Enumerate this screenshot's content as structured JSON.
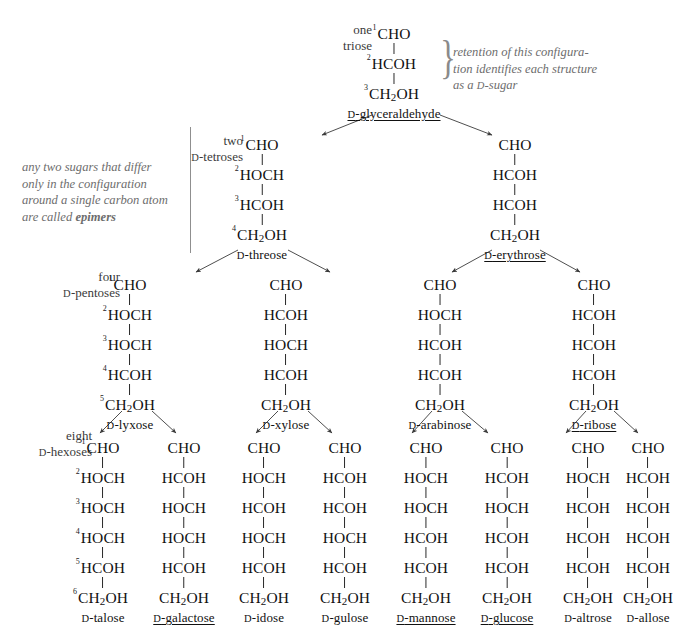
{
  "diagram": {
    "background": "#ffffff",
    "bond_color": "#2a2a2a",
    "annotation_color": "#6d6d6d"
  },
  "row_labels": [
    {
      "id": "triose",
      "line1": "one",
      "line2": "triose",
      "x": 372,
      "y": 22
    },
    {
      "id": "tetrose",
      "line1": "two",
      "line2": "D-tetroses",
      "x": 243,
      "y": 133
    },
    {
      "id": "pentose",
      "line1": "four",
      "line2": "D-pentoses",
      "x": 120,
      "y": 269
    },
    {
      "id": "hexose",
      "line1": "eight",
      "line2": "D-hexoses",
      "x": 92,
      "y": 428
    }
  ],
  "annotations": [
    {
      "id": "d-sugar-note",
      "x": 453,
      "y": 44,
      "brace_x": 437,
      "brace_y": 35,
      "lines": [
        "retention of this configura-",
        "tion identifies each structure",
        "as a D-sugar"
      ]
    },
    {
      "id": "epimer-note",
      "x": 22,
      "y": 159,
      "bar_x": 190,
      "bar_y": 127,
      "bar_h": 126,
      "lines": [
        "any two sugars that differ",
        "only in the configuration",
        "around a single carbon atom",
        "are called epimers"
      ],
      "bold_word": "epimers"
    }
  ],
  "structures": [
    {
      "id": "d-glyceraldehyde",
      "name": "D-glyceraldehyde",
      "underlined": true,
      "numbered": true,
      "x": 394,
      "y": 26,
      "groups": [
        "CHO",
        "HCOH",
        "CH2OH"
      ]
    },
    {
      "id": "d-threose",
      "name": "D-threose",
      "underlined": false,
      "numbered": true,
      "x": 262,
      "y": 137,
      "groups": [
        "CHO",
        "HOCH",
        "HCOH",
        "CH2OH"
      ]
    },
    {
      "id": "d-erythrose",
      "name": "D-erythrose",
      "underlined": true,
      "numbered": false,
      "x": 515,
      "y": 137,
      "groups": [
        "CHO",
        "HCOH",
        "HCOH",
        "CH2OH"
      ]
    },
    {
      "id": "d-lyxose",
      "name": "D-lyxose",
      "underlined": false,
      "numbered": true,
      "x": 130,
      "y": 277,
      "groups": [
        "CHO",
        "HOCH",
        "HOCH",
        "HCOH",
        "CH2OH"
      ]
    },
    {
      "id": "d-xylose",
      "name": "D-xylose",
      "underlined": false,
      "numbered": false,
      "x": 286,
      "y": 277,
      "groups": [
        "CHO",
        "HCOH",
        "HOCH",
        "HCOH",
        "CH2OH"
      ]
    },
    {
      "id": "d-arabinose",
      "name": "D-arabinose",
      "underlined": false,
      "numbered": false,
      "x": 440,
      "y": 277,
      "groups": [
        "CHO",
        "HOCH",
        "HCOH",
        "HCOH",
        "CH2OH"
      ]
    },
    {
      "id": "d-ribose",
      "name": "D-ribose",
      "underlined": true,
      "numbered": false,
      "x": 594,
      "y": 277,
      "groups": [
        "CHO",
        "HCOH",
        "HCOH",
        "HCOH",
        "CH2OH"
      ]
    },
    {
      "id": "d-talose",
      "name": "D-talose",
      "underlined": false,
      "numbered": true,
      "x": 103,
      "y": 440,
      "groups": [
        "CHO",
        "HOCH",
        "HOCH",
        "HOCH",
        "HCOH",
        "CH2OH"
      ]
    },
    {
      "id": "d-galactose",
      "name": "D-galactose",
      "underlined": true,
      "numbered": false,
      "x": 184,
      "y": 440,
      "groups": [
        "CHO",
        "HCOH",
        "HOCH",
        "HOCH",
        "HCOH",
        "CH2OH"
      ]
    },
    {
      "id": "d-idose",
      "name": "D-idose",
      "underlined": false,
      "numbered": false,
      "x": 264,
      "y": 440,
      "groups": [
        "CHO",
        "HOCH",
        "HCOH",
        "HOCH",
        "HCOH",
        "CH2OH"
      ]
    },
    {
      "id": "d-gulose",
      "name": "D-gulose",
      "underlined": false,
      "numbered": false,
      "x": 345,
      "y": 440,
      "groups": [
        "CHO",
        "HCOH",
        "HCOH",
        "HOCH",
        "HCOH",
        "CH2OH"
      ]
    },
    {
      "id": "d-mannose",
      "name": "D-mannose",
      "underlined": true,
      "numbered": false,
      "x": 426,
      "y": 440,
      "groups": [
        "CHO",
        "HOCH",
        "HOCH",
        "HCOH",
        "HCOH",
        "CH2OH"
      ]
    },
    {
      "id": "d-glucose",
      "name": "D-glucose",
      "underlined": true,
      "numbered": false,
      "x": 507,
      "y": 440,
      "groups": [
        "CHO",
        "HCOH",
        "HOCH",
        "HCOH",
        "HCOH",
        "CH2OH"
      ]
    },
    {
      "id": "d-altrose",
      "name": "D-altrose",
      "underlined": false,
      "numbered": false,
      "x": 588,
      "y": 440,
      "groups": [
        "CHO",
        "HOCH",
        "HCOH",
        "HCOH",
        "HCOH",
        "CH2OH"
      ]
    },
    {
      "id": "d-allose",
      "name": "D-allose",
      "underlined": false,
      "numbered": false,
      "x": 648,
      "y": 440,
      "groups": [
        "CHO",
        "HCOH",
        "HCOH",
        "HCOH",
        "HCOH",
        "CH2OH"
      ]
    }
  ],
  "arrows": [
    {
      "from": "d-glyceraldehyde",
      "to": "d-threose",
      "x1": 372,
      "y1": 115,
      "x2": 322,
      "y2": 135
    },
    {
      "from": "d-glyceraldehyde",
      "to": "d-erythrose",
      "x1": 440,
      "y1": 115,
      "x2": 492,
      "y2": 135
    },
    {
      "from": "d-threose",
      "to": "d-lyxose",
      "x1": 238,
      "y1": 250,
      "x2": 196,
      "y2": 272
    },
    {
      "from": "d-threose",
      "to": "d-xylose",
      "x1": 288,
      "y1": 250,
      "x2": 330,
      "y2": 272
    },
    {
      "from": "d-erythrose",
      "to": "d-arabinose",
      "x1": 492,
      "y1": 250,
      "x2": 452,
      "y2": 272
    },
    {
      "from": "d-erythrose",
      "to": "d-ribose",
      "x1": 540,
      "y1": 250,
      "x2": 580,
      "y2": 272
    },
    {
      "from": "d-lyxose",
      "to": "d-talose",
      "x1": 122,
      "y1": 411,
      "x2": 100,
      "y2": 433
    },
    {
      "from": "d-lyxose",
      "to": "d-galactose",
      "x1": 152,
      "y1": 411,
      "x2": 176,
      "y2": 433
    },
    {
      "from": "d-xylose",
      "to": "d-idose",
      "x1": 278,
      "y1": 411,
      "x2": 256,
      "y2": 433
    },
    {
      "from": "d-xylose",
      "to": "d-gulose",
      "x1": 308,
      "y1": 411,
      "x2": 332,
      "y2": 433
    },
    {
      "from": "d-arabinose",
      "to": "d-mannose",
      "x1": 432,
      "y1": 411,
      "x2": 412,
      "y2": 433
    },
    {
      "from": "d-arabinose",
      "to": "d-glucose",
      "x1": 462,
      "y1": 411,
      "x2": 488,
      "y2": 433
    },
    {
      "from": "d-ribose",
      "to": "d-altrose",
      "x1": 586,
      "y1": 411,
      "x2": 566,
      "y2": 433
    },
    {
      "from": "d-ribose",
      "to": "d-allose",
      "x1": 614,
      "y1": 411,
      "x2": 638,
      "y2": 433
    }
  ]
}
